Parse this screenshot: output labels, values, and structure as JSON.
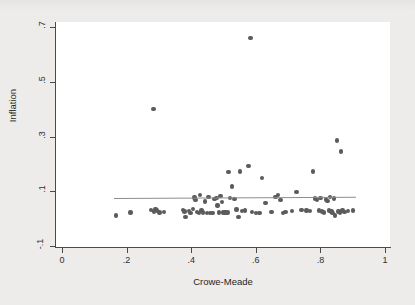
{
  "chart_data": {
    "type": "scatter",
    "title": "",
    "xlabel": "Crowe-Meade",
    "ylabel": "Inflation",
    "xlim": [
      0,
      1
    ],
    "ylim": [
      -0.1,
      0.7
    ],
    "xticks": [
      "0",
      ".2",
      ".4",
      ".6",
      ".8",
      "1"
    ],
    "xtick_values": [
      0,
      0.2,
      0.4,
      0.6,
      0.8,
      1
    ],
    "yticks": [
      ".7",
      ".5",
      ".3",
      ".1",
      "-.1"
    ],
    "ytick_values": [
      0.7,
      0.5,
      0.3,
      0.1,
      -0.1
    ],
    "grid": false,
    "legend": "none",
    "marker_color": "#5b5b5b",
    "fitline_color": "#8d8d8d",
    "plot_bg": "#ffffff",
    "figure_bg": "#edecea",
    "series": [
      {
        "name": "countries",
        "points": [
          [
            0.168,
            0.012
          ],
          [
            0.212,
            0.022
          ],
          [
            0.276,
            0.031
          ],
          [
            0.283,
            0.4
          ],
          [
            0.285,
            0.026
          ],
          [
            0.29,
            0.036
          ],
          [
            0.294,
            0.03
          ],
          [
            0.302,
            0.022
          ],
          [
            0.316,
            0.024
          ],
          [
            0.375,
            0.031
          ],
          [
            0.379,
            0.026
          ],
          [
            0.382,
            0.005
          ],
          [
            0.393,
            0.028
          ],
          [
            0.398,
            0.02
          ],
          [
            0.405,
            0.035
          ],
          [
            0.41,
            0.077
          ],
          [
            0.413,
            0.069
          ],
          [
            0.418,
            0.024
          ],
          [
            0.424,
            0.02
          ],
          [
            0.428,
            0.086
          ],
          [
            0.432,
            0.03
          ],
          [
            0.437,
            0.022
          ],
          [
            0.442,
            0.063
          ],
          [
            0.449,
            0.02
          ],
          [
            0.454,
            0.078
          ],
          [
            0.459,
            0.02
          ],
          [
            0.466,
            0.021
          ],
          [
            0.472,
            0.071
          ],
          [
            0.478,
            0.076
          ],
          [
            0.482,
            0.048
          ],
          [
            0.486,
            0.022
          ],
          [
            0.491,
            0.083
          ],
          [
            0.495,
            0.06
          ],
          [
            0.498,
            0.022
          ],
          [
            0.503,
            0.023
          ],
          [
            0.508,
            0.022
          ],
          [
            0.512,
            0.023
          ],
          [
            0.516,
            0.17
          ],
          [
            0.521,
            0.075
          ],
          [
            0.527,
            0.117
          ],
          [
            0.534,
            0.072
          ],
          [
            0.54,
            0.034
          ],
          [
            0.546,
            0.006
          ],
          [
            0.552,
            0.172
          ],
          [
            0.558,
            0.028
          ],
          [
            0.566,
            0.03
          ],
          [
            0.577,
            0.192
          ],
          [
            0.583,
            0.66
          ],
          [
            0.589,
            0.024
          ],
          [
            0.6,
            0.02
          ],
          [
            0.612,
            0.02
          ],
          [
            0.62,
            0.148
          ],
          [
            0.63,
            0.057
          ],
          [
            0.648,
            0.025
          ],
          [
            0.661,
            0.078
          ],
          [
            0.668,
            0.086
          ],
          [
            0.677,
            0.068
          ],
          [
            0.685,
            0.021
          ],
          [
            0.692,
            0.024
          ],
          [
            0.712,
            0.028
          ],
          [
            0.726,
            0.098
          ],
          [
            0.741,
            0.031
          ],
          [
            0.757,
            0.03
          ],
          [
            0.768,
            0.028
          ],
          [
            0.778,
            0.172
          ],
          [
            0.784,
            0.074
          ],
          [
            0.79,
            0.068
          ],
          [
            0.796,
            0.03
          ],
          [
            0.8,
            0.076
          ],
          [
            0.805,
            0.026
          ],
          [
            0.812,
            0.023
          ],
          [
            0.818,
            0.07
          ],
          [
            0.822,
            0.064
          ],
          [
            0.826,
            0.03
          ],
          [
            0.83,
            0.078
          ],
          [
            0.834,
            0.026
          ],
          [
            0.838,
            0.021
          ],
          [
            0.842,
            0.073
          ],
          [
            0.846,
            0.012
          ],
          [
            0.852,
            0.285
          ],
          [
            0.856,
            0.026
          ],
          [
            0.86,
            0.022
          ],
          [
            0.864,
            0.245
          ],
          [
            0.868,
            0.03
          ],
          [
            0.874,
            0.024
          ],
          [
            0.886,
            0.028
          ],
          [
            0.901,
            0.03
          ]
        ]
      }
    ],
    "fitline": {
      "name": "linear fit",
      "x0": 0.16,
      "y0": 0.074,
      "x1": 0.91,
      "y1": 0.079
    }
  }
}
